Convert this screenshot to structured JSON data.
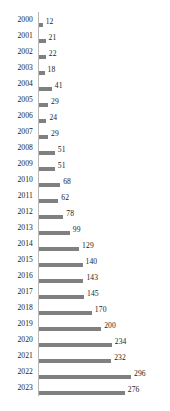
{
  "chart_data": {
    "type": "bar",
    "orientation": "horizontal",
    "title": "",
    "subtitle": "",
    "xlabel": "",
    "ylabel": "",
    "grid": false,
    "legend": null,
    "legend_position": "none",
    "xlim": [
      0,
      296
    ],
    "categories": [
      "2000",
      "2001",
      "2002",
      "2003",
      "2004",
      "2005",
      "2006",
      "2007",
      "2008",
      "2009",
      "2010",
      "2011",
      "2012",
      "2013",
      "2014",
      "2015",
      "2016",
      "2017",
      "2018",
      "2019",
      "2020",
      "2021",
      "2022",
      "2023"
    ],
    "values": [
      12,
      21,
      22,
      18,
      41,
      29,
      24,
      29,
      51,
      51,
      68,
      62,
      78,
      99,
      129,
      140,
      143,
      145,
      170,
      200,
      234,
      232,
      296,
      276
    ],
    "data_labels": [
      "12",
      "21",
      "22",
      "18",
      "41",
      "29",
      "24",
      "29",
      "51",
      "51",
      "68",
      "62",
      "78",
      "99",
      "129",
      "140",
      "143",
      "145",
      "170",
      "200",
      "234",
      "232",
      "296",
      "276"
    ],
    "colors": {
      "bar": "#808080",
      "axis_line": "#b8b8b8",
      "text": "#1a1a1a",
      "background": "#ffffff"
    },
    "scale_px_per_unit": 0.311
  }
}
